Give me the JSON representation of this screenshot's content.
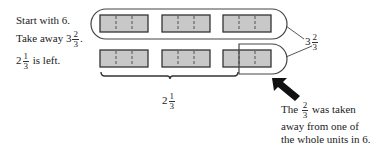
{
  "left_text": {
    "line1": "Start with 6.",
    "line2_prefix": "Take away 3",
    "line2_num": "2",
    "line2_den": "3",
    "line2_suffix": ".",
    "line3_whole": "2",
    "line3_num": "1",
    "line3_den": "3",
    "line3_suffix": " is left."
  },
  "diagram": {
    "top_row_units": 3,
    "bottom_row_units": 3,
    "unit_parts": 3,
    "bar_fill": "#c8c8c8",
    "bar_stroke": "#333333"
  },
  "labels": {
    "taken": {
      "whole": "3",
      "num": "2",
      "den": "3"
    },
    "left": {
      "whole": "2",
      "num": "1",
      "den": "3"
    }
  },
  "note": {
    "prefix": "The",
    "num": "2",
    "den": "3",
    "suffix": "was taken",
    "line2": "away from one of",
    "line3": "the whole units in 6."
  }
}
